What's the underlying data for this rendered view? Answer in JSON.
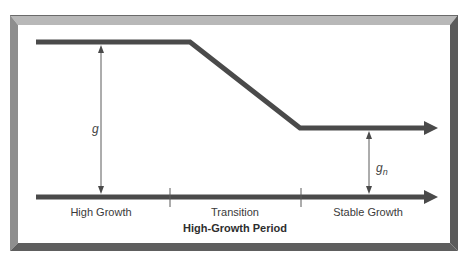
{
  "diagram": {
    "type": "growth-stage-diagram",
    "colors": {
      "line": "#4a4a4a",
      "thin_line": "#5a5a5a",
      "frame_light": "#b4b4b4",
      "frame_mid": "#8c8c8c",
      "frame_dark": "#555555",
      "text": "#3a3a3a"
    },
    "labels": {
      "g": "g",
      "gn_base": "g",
      "gn_sub": "n",
      "phase_1": "High Growth",
      "phase_2": "Transition",
      "phase_3": "Stable Growth",
      "period": "High-Growth Period"
    },
    "phases": [
      {
        "name": "High Growth",
        "growth_rate": "g"
      },
      {
        "name": "Transition",
        "growth_rate": "declining from g to gn"
      },
      {
        "name": "Stable Growth",
        "growth_rate": "gn"
      }
    ]
  }
}
